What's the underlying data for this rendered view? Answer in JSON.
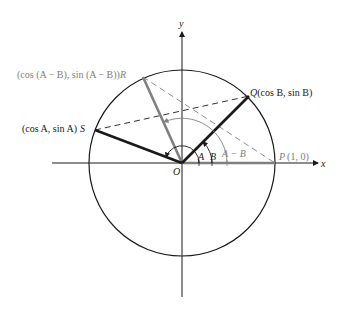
{
  "diagram": {
    "axes": {
      "x_label": "x",
      "y_label": "y",
      "origin_label": "O"
    },
    "points": {
      "P": {
        "name": "P",
        "coords": "(1, 0)",
        "color": "#808080"
      },
      "Q": {
        "name": "Q",
        "coords": "(cos B, sin B)",
        "color": "#1a1a1a"
      },
      "R": {
        "name": "R",
        "coords": "(cos (A − B), sin (A − B))",
        "color": "#808080"
      },
      "S": {
        "name": "S",
        "coords": "(cos A, sin A)",
        "color": "#1a1a1a"
      }
    },
    "angles": {
      "A": "A",
      "B": "B",
      "A_minus_B": "A − B"
    },
    "labels": {
      "Q_prefix": "Q",
      "Q_text": "(cos B, sin B)",
      "R_text": "(cos (A − B), sin (A − B))",
      "R_suffix": "R",
      "S_text": "(cos A, sin A)",
      "S_suffix": "S",
      "P_prefix": "P",
      "P_text": "(1, 0)"
    },
    "colors": {
      "black": "#1a1a1a",
      "gray": "#808080",
      "background": "#ffffff"
    }
  }
}
